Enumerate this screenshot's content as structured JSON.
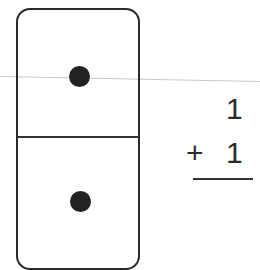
{
  "domino": {
    "top_pips": 1,
    "bottom_pips": 1,
    "pip_icon": "dot-icon"
  },
  "problem": {
    "addend_top": "1",
    "operator": "+",
    "addend_bottom": "1",
    "answer": ""
  },
  "colors": {
    "ink": "#2a2a2a",
    "background": "#ffffff"
  }
}
